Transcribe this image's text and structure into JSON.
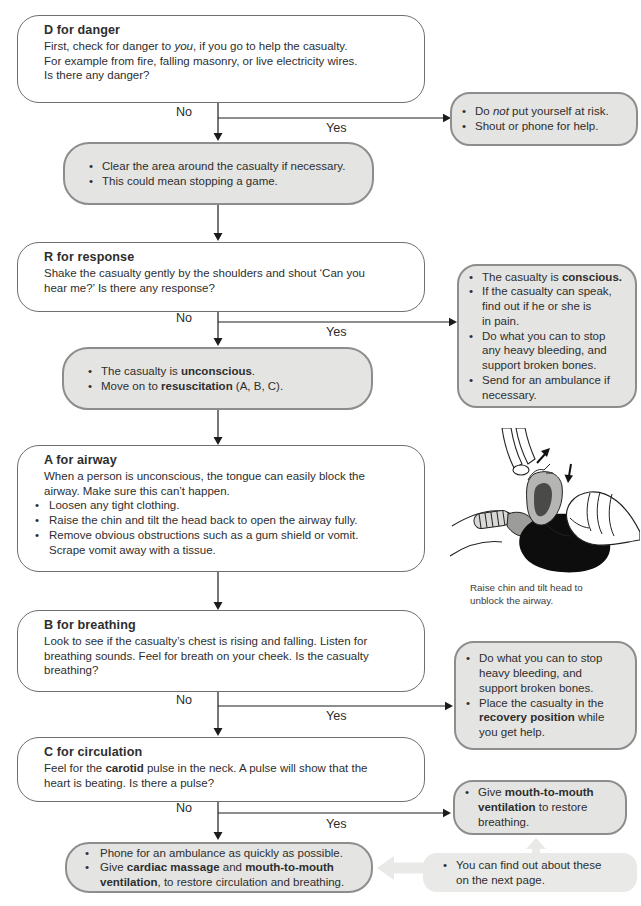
{
  "labels": {
    "no": "No",
    "yes": "Yes"
  },
  "colors": {
    "box_border": "#6f6f6f",
    "gray_box_fill": "#e4e4e2",
    "gray_box_border": "#8d8d8d",
    "light_arrow_fill": "#e9e9e7",
    "line_color": "#1c1c1c",
    "text": "#2e2e2e"
  },
  "danger": {
    "title": "D for danger",
    "body": "First, check for danger to *you*, if you go to help the casualty.\nFor example from fire, falling masonry, or live electricity wires.\nIs there any danger?"
  },
  "danger_yes": {
    "items": [
      "Do *not* put yourself at risk.",
      "Shout or phone for help."
    ]
  },
  "danger_no": {
    "items": [
      "Clear the area around the casualty if necessary.",
      "This could mean stopping a game."
    ]
  },
  "response": {
    "title": "R for response",
    "body": "Shake the casualty gently by the shoulders and shout ‘Can you\nhear me?’ Is there any response?"
  },
  "response_yes": {
    "items": [
      "The casualty is **conscious.**",
      "If the casualty can speak,\nfind out if he or she is\nin pain.",
      "Do what you can to stop\nany heavy bleeding, and\nsupport broken bones.",
      "Send for an ambulance if\nnecessary."
    ]
  },
  "response_no": {
    "items": [
      "The casualty is **unconscious**.",
      "Move on to **resuscitation** (A, B, C)."
    ]
  },
  "airway": {
    "title": "A for airway",
    "body": "When a person is unconscious, the tongue can easily block the\nairway. Make sure this can’t happen.",
    "items": [
      "Loosen any tight clothing.",
      "Raise the chin and tilt the head back to open the airway fully.",
      "Remove obvious obstructions such as a gum shield or vomit.\nScrape vomit away with a tissue."
    ]
  },
  "airway_figure": {
    "caption": "Raise chin and tilt head to\nunblock the airway."
  },
  "breathing": {
    "title": "B for breathing",
    "body": "Look to see if the casualty’s chest is rising and falling. Listen for\nbreathing sounds. Feel for breath on your cheek. Is the casualty\nbreathing?"
  },
  "breathing_yes": {
    "items": [
      "Do what you can to stop\nheavy bleeding, and\nsupport broken bones.",
      "Place the casualty in the\n**recovery position** while\nyou get help."
    ]
  },
  "circulation": {
    "title": "C for circulation",
    "body": "Feel for the **carotid** pulse in the neck. A pulse will show that the\nheart is beating. Is there a pulse?"
  },
  "circulation_yes": {
    "items": [
      "Give **mouth-to-mouth**\n**ventilation** to restore\nbreathing."
    ]
  },
  "circulation_no": {
    "items": [
      "Phone for an ambulance as quickly as possible.",
      "Give **cardiac massage** and **mouth-to-mouth**\n**ventilation**, to restore circulation and breathing."
    ]
  },
  "note": {
    "items": [
      "You can find out about these\non the next page."
    ]
  }
}
